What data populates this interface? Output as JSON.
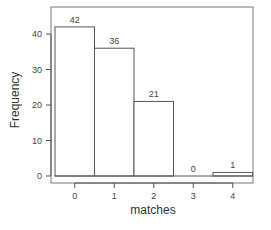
{
  "chart_data": {
    "type": "bar",
    "title": "",
    "xlabel": "matches",
    "ylabel": "Frequency",
    "categories": [
      "0",
      "1",
      "2",
      "3",
      "4"
    ],
    "values": [
      42,
      36,
      21,
      0,
      1
    ],
    "bar_labels": [
      "42",
      "36",
      "21",
      "0",
      "1"
    ],
    "yticks": [
      "0",
      "10",
      "20",
      "30",
      "40"
    ],
    "ylim": [
      0,
      45
    ],
    "grid": false,
    "legend": null
  },
  "colors": {
    "bar_fill": "#ffffff",
    "bar_stroke": "#555555",
    "text": "#444444"
  }
}
